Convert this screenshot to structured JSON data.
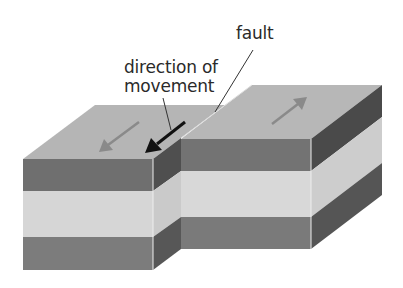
{
  "diagram": {
    "type": "strike-slip fault block diagram",
    "labels": {
      "fault": "fault",
      "direction_line1": "direction of",
      "direction_line2": "movement"
    },
    "colors": {
      "top_surface": "#b5b5b5",
      "dark_layer": "#6f6f6f",
      "dark_layer_side": "#4f4f4f",
      "light_layer": "#d6d6d6",
      "light_layer_side": "#c4c4c4",
      "arrow_gray": "#8a8a8a",
      "arrow_black": "#111111",
      "leader_line": "#333333"
    },
    "blocks": [
      {
        "name": "left-block",
        "movement": "toward viewer (down-left)"
      },
      {
        "name": "right-block",
        "movement": "away from viewer (up-right)"
      }
    ],
    "layers": [
      "dark top layer",
      "light middle layer",
      "dark bottom layer"
    ]
  }
}
